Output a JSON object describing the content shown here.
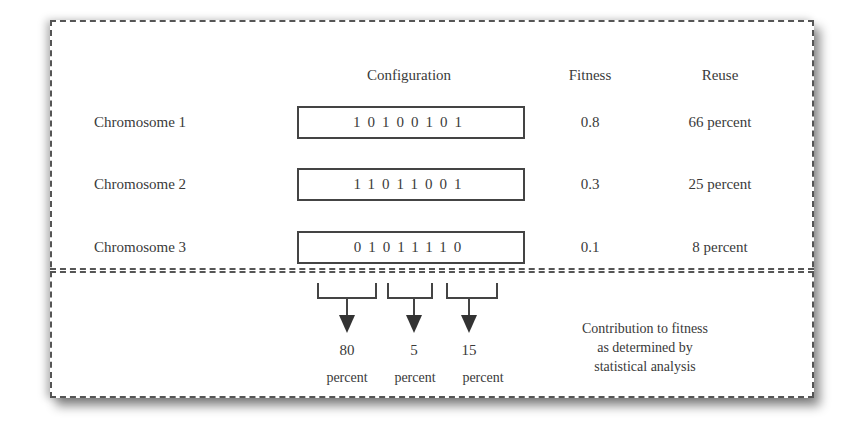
{
  "headers": {
    "configuration": "Configuration",
    "fitness": "Fitness",
    "reuse": "Reuse"
  },
  "chromosomes": [
    {
      "label": "Chromosome 1",
      "bits": "10100101",
      "fitness": "0.8",
      "reuse": "66 percent"
    },
    {
      "label": "Chromosome 2",
      "bits": "11011001",
      "fitness": "0.3",
      "reuse": "25 percent"
    },
    {
      "label": "Chromosome 3",
      "bits": "01011110",
      "fitness": "0.1",
      "reuse": "8 percent"
    }
  ],
  "contributions": [
    {
      "value": "80",
      "unit": "percent",
      "bit_range": "bits 1-3"
    },
    {
      "value": "5",
      "unit": "percent",
      "bit_range": "bits 4-5"
    },
    {
      "value": "15",
      "unit": "percent",
      "bit_range": "bits 6-7"
    }
  ],
  "note": {
    "line1": "Contribution to fitness",
    "line2": "as determined by",
    "line3": "statistical analysis"
  },
  "colors": {
    "line": "#444444",
    "text": "#3a3a3a",
    "background": "#ffffff"
  }
}
